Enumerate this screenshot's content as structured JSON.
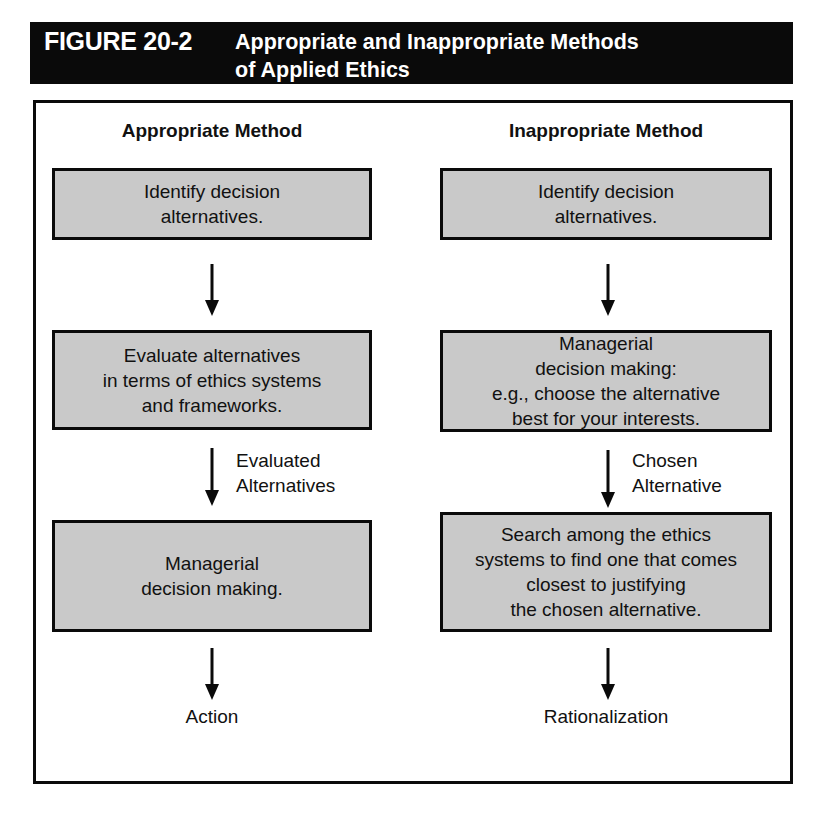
{
  "figure": {
    "number_label": "FIGURE 20-2",
    "title": "Appropriate and Inappropriate Methods\nof Applied Ethics",
    "header_bg": "#0a0a0a",
    "header_fg": "#ffffff",
    "box_fill": "#c9c9c9",
    "line_color": "#0a0a0a"
  },
  "columns": {
    "left": {
      "heading": "Appropriate Method",
      "steps": [
        {
          "text": "Identify decision\nalternatives."
        },
        {
          "text": "Evaluate alternatives\nin terms of ethics systems\nand frameworks."
        },
        {
          "text": "Managerial\ndecision making."
        }
      ],
      "connector_label": "Evaluated\nAlternatives",
      "outcome": "Action"
    },
    "right": {
      "heading": "Inappropriate Method",
      "steps": [
        {
          "text": "Identify decision\nalternatives."
        },
        {
          "text": "Managerial\ndecision making:\ne.g., choose the alternative\nbest for your interests."
        },
        {
          "text": "Search among the ethics\nsystems to find one that comes\nclosest to justifying\nthe chosen alternative."
        }
      ],
      "connector_label": "Chosen\nAlternative",
      "outcome": "Rationalization"
    }
  }
}
